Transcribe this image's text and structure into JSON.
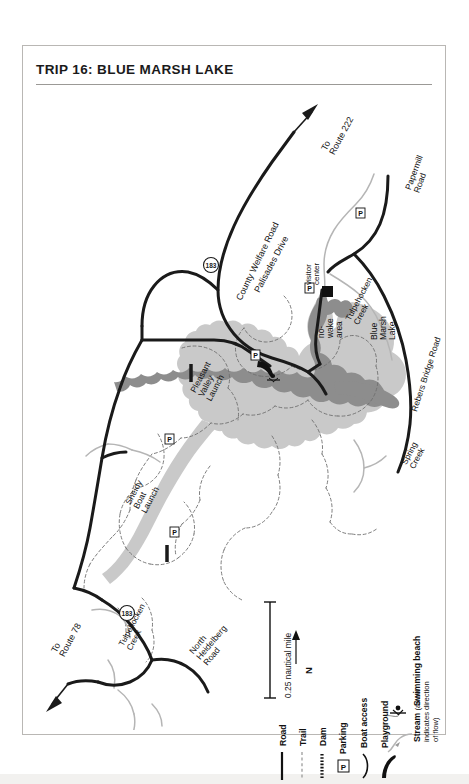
{
  "document": {
    "title": "TRIP 16: BLUE MARSH LAKE"
  },
  "map": {
    "roads": [
      {
        "name": "County Welfare Road"
      },
      {
        "name": "Papermill Road"
      },
      {
        "name": "Rebers Bridge Road"
      },
      {
        "name": "Palisades Drive"
      },
      {
        "name": "North Heidelberg Road"
      }
    ],
    "route_shields": [
      {
        "number": "183"
      },
      {
        "number": "183"
      }
    ],
    "direction_labels": [
      {
        "text": "To\nRoute 222"
      },
      {
        "text": "To\nRoute 78"
      }
    ],
    "direction_to_222_line1": "To",
    "direction_to_222_line2": "Route 222",
    "direction_to_78_line1": "To",
    "direction_to_78_line2": "Route 78",
    "water_features": [
      {
        "name": "Blue Marsh Lake"
      },
      {
        "name": "Tulpehocken Creek"
      },
      {
        "name": "Tulpehocken Creek"
      },
      {
        "name": "Spring Creek"
      }
    ],
    "lake_name_line1": "Blue",
    "lake_name_line2": "Marsh",
    "lake_name_line3": "Lake",
    "tulpehocken_upper_line1": "Tulpehocken",
    "tulpehocken_upper_line2": "Creek",
    "tulpehocken_lower_line1": "Tulpehocken",
    "tulpehocken_lower_line2": "Creek",
    "spring_creek_line1": "Spring",
    "spring_creek_line2": "Creek",
    "papermill_line1": "Papermill",
    "papermill_line2": "Road",
    "rebers_line": "Rebers Bridge Road",
    "welfare_line": "County Welfare Road",
    "palisades_line": "Palisades Drive",
    "heidelberg_line1": "North",
    "heidelberg_line2": "Heidelberg",
    "heidelberg_line3": "Road",
    "points_of_interest": [
      {
        "name": "visitor center"
      },
      {
        "name": "no-wake area"
      },
      {
        "name": "Pleasant Valley Launch"
      },
      {
        "name": "Sheidy Boat Launch"
      }
    ],
    "visitor_center_line1": "visitor",
    "visitor_center_line2": "center",
    "nowake_line1": "no-",
    "nowake_line2": "wake",
    "nowake_line3": "area",
    "pleasant_line1": "Pleasant",
    "pleasant_line2": "Valley",
    "pleasant_line3": "Launch",
    "sheidy_line1": "Sheidy",
    "sheidy_line2": "Boat",
    "sheidy_line3": "Launch",
    "colors": {
      "lake_light": "#c9c9c9",
      "lake_dark": "#8d8d8d",
      "road": "#1a1a1a",
      "stream": "#b5b5b5",
      "trail": "#8a8a8a",
      "paper": "#ffffff"
    }
  },
  "scale": {
    "label": "0.25 nautical mile"
  },
  "compass": {
    "label": "N"
  },
  "legend": {
    "items": [
      {
        "label": "Road",
        "symbol": "solid-line"
      },
      {
        "label": "Trail",
        "symbol": "dashed-line"
      },
      {
        "label": "Dam",
        "symbol": "dotted-thick-line"
      },
      {
        "label": "Parking",
        "symbol": "parking-box",
        "glyph": "P"
      },
      {
        "label": "Boat access",
        "symbol": "boat-ramp"
      },
      {
        "label": "Playground",
        "symbol": "playground-slide"
      },
      {
        "label": "Swimming beach",
        "symbol": "swimmer"
      },
      {
        "label": "Stream",
        "symbol": "stream-line",
        "note_line1": "(arrow",
        "note_line2": "indicates direction",
        "note_line3": "of flow)"
      }
    ],
    "parking_glyph": "P"
  }
}
